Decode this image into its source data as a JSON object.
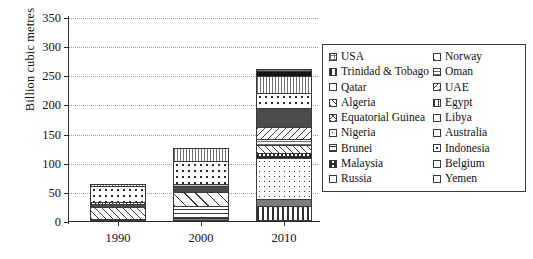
{
  "chart_data": {
    "type": "bar",
    "stacked": true,
    "title": "",
    "xlabel": "",
    "ylabel": "Billion cubic metres",
    "categories": [
      "1990",
      "2000",
      "2010"
    ],
    "ylim": [
      0,
      350
    ],
    "yticks": [
      0,
      50,
      100,
      150,
      200,
      250,
      300,
      350
    ],
    "grid": true,
    "legend_position": "right",
    "totals": [
      72,
      136,
      295
    ],
    "series": [
      {
        "name": "USA",
        "pattern": "grid",
        "values": [
          3,
          5,
          0
        ]
      },
      {
        "name": "Trinidad & Tobago",
        "pattern": "vert-bold",
        "values": [
          0,
          0,
          26
        ]
      },
      {
        "name": "Qatar",
        "pattern": "solid-mdgray",
        "values": [
          0,
          0,
          14
        ]
      },
      {
        "name": "Algeria",
        "pattern": "diag",
        "values": [
          22,
          0,
          0
        ]
      },
      {
        "name": "Equatorial Guinea",
        "pattern": "cross",
        "values": [
          0,
          0,
          0
        ]
      },
      {
        "name": "Nigeria",
        "pattern": "dot-sm",
        "values": [
          0,
          0,
          71
        ]
      },
      {
        "name": "Brunei",
        "pattern": "horiz",
        "values": [
          0,
          22,
          0
        ]
      },
      {
        "name": "Malaysia",
        "pattern": "checker",
        "values": [
          0,
          0,
          11
        ]
      },
      {
        "name": "Russia",
        "pattern": "solid-black",
        "values": [
          0,
          0,
          10
        ]
      },
      {
        "name": "Norway",
        "pattern": "diag-wide",
        "values": [
          0,
          27,
          16
        ]
      },
      {
        "name": "Oman",
        "pattern": "horiz-fine",
        "values": [
          0,
          0,
          11
        ]
      },
      {
        "name": "UAE",
        "pattern": "diag-back",
        "values": [
          0,
          0,
          22
        ]
      },
      {
        "name": "Egypt",
        "pattern": "solid-dkgray",
        "values": [
          7,
          12,
          35
        ]
      },
      {
        "name": "Libya",
        "pattern": "solid-ltgray",
        "values": [
          5,
          5,
          0
        ]
      },
      {
        "name": "Australia",
        "pattern": "dot-md",
        "values": [
          30,
          40,
          28
        ]
      },
      {
        "name": "Indonesia",
        "pattern": "vert-fine",
        "values": [
          4,
          22,
          31
        ]
      },
      {
        "name": "Belgium",
        "pattern": "white",
        "values": [
          0,
          0,
          0
        ]
      },
      {
        "name": "Yemen",
        "pattern": "vert",
        "values": [
          0,
          0,
          5
        ]
      }
    ],
    "stacks": [
      {
        "category": "1990",
        "total": 72,
        "segments": [
          {
            "label": "USA",
            "value": 3,
            "pattern": "grid"
          },
          {
            "label": "Algeria",
            "value": 22,
            "pattern": "diag"
          },
          {
            "label": "Egypt",
            "value": 7,
            "pattern": "solid-dkgray"
          },
          {
            "label": "Libya",
            "value": 5,
            "pattern": "cross"
          },
          {
            "label": "Australia",
            "value": 30,
            "pattern": "dot-md"
          },
          {
            "label": "Indonesia",
            "value": 5,
            "pattern": "vert-fine"
          }
        ]
      },
      {
        "category": "2000",
        "total": 136,
        "segments": [
          {
            "label": "USA",
            "value": 5,
            "pattern": "grid"
          },
          {
            "label": "Brunei",
            "value": 22,
            "pattern": "horiz"
          },
          {
            "label": "Norway",
            "value": 27,
            "pattern": "diag-wide"
          },
          {
            "label": "Egypt",
            "value": 12,
            "pattern": "solid-dkgray"
          },
          {
            "label": "Libya",
            "value": 5,
            "pattern": "solid-ltgray"
          },
          {
            "label": "Australia",
            "value": 40,
            "pattern": "dot-md"
          },
          {
            "label": "Indonesia",
            "value": 25,
            "pattern": "vert-fine"
          }
        ]
      },
      {
        "category": "2010",
        "total": 295,
        "segments": [
          {
            "label": "Trinidad & Tobago",
            "value": 26,
            "pattern": "vert-bold"
          },
          {
            "label": "Qatar",
            "value": 14,
            "pattern": "solid-mdgray"
          },
          {
            "label": "Nigeria",
            "value": 71,
            "pattern": "dot-sm"
          },
          {
            "label": "Malaysia",
            "value": 11,
            "pattern": "checker"
          },
          {
            "label": "Norway",
            "value": 16,
            "pattern": "diag"
          },
          {
            "label": "Oman",
            "value": 11,
            "pattern": "horiz-fine"
          },
          {
            "label": "UAE",
            "value": 22,
            "pattern": "diag-back"
          },
          {
            "label": "Egypt",
            "value": 35,
            "pattern": "solid-dkgray"
          },
          {
            "label": "Australia",
            "value": 28,
            "pattern": "dot-md"
          },
          {
            "label": "Indonesia",
            "value": 31,
            "pattern": "vert-fine"
          },
          {
            "label": "Russia",
            "value": 10,
            "pattern": "solid-black"
          },
          {
            "label": "Yemen",
            "value": 5,
            "pattern": "grid"
          }
        ]
      }
    ],
    "legend": {
      "column_left": [
        {
          "label": "USA",
          "pattern": "grid"
        },
        {
          "label": "Trinidad & Tobago",
          "pattern": "vert-bold"
        },
        {
          "label": "Qatar",
          "pattern": "white"
        },
        {
          "label": "Algeria",
          "pattern": "diag"
        },
        {
          "label": "Equatorial Guinea",
          "pattern": "cross"
        },
        {
          "label": "Nigeria",
          "pattern": "dot-sm"
        },
        {
          "label": "Brunei",
          "pattern": "horiz"
        },
        {
          "label": "Malaysia",
          "pattern": "checker"
        },
        {
          "label": "Russia",
          "pattern": "solid-black"
        }
      ],
      "column_right": [
        {
          "label": "Norway",
          "pattern": "diag-wide"
        },
        {
          "label": "Oman",
          "pattern": "horiz-fine"
        },
        {
          "label": "UAE",
          "pattern": "diag-back"
        },
        {
          "label": "Egypt",
          "pattern": "vert"
        },
        {
          "label": "Libya",
          "pattern": "solid-mdgray"
        },
        {
          "label": "Australia",
          "pattern": "solid-dkgray"
        },
        {
          "label": "Indonesia",
          "pattern": "dot-md"
        },
        {
          "label": "Belgium",
          "pattern": "white"
        },
        {
          "label": "Yemen",
          "pattern": "solid-ltgray"
        }
      ]
    },
    "colors": {
      "axis": "#2b2b2b",
      "gridline": "#9a9a9a",
      "segment_border": "#3a3a3a",
      "background": "#ffffff",
      "text": "#111111"
    }
  }
}
